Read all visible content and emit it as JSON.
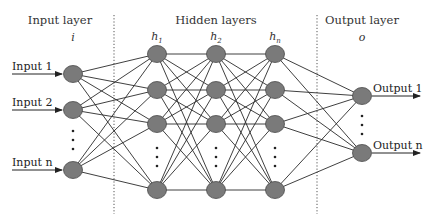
{
  "diagram": {
    "type": "feedforward-neural-network",
    "layers": [
      {
        "title": "Input layer",
        "symbol": "i"
      },
      {
        "title": "Hidden layers",
        "symbols": [
          "h1",
          "h2",
          "hn"
        ]
      },
      {
        "title": "Output layer",
        "symbol": "o"
      }
    ],
    "inputs": [
      "Input 1",
      "Input 2",
      "Input n"
    ],
    "outputs": [
      "Output 1",
      "Output n"
    ],
    "hidden_symbols": {
      "h1": {
        "base": "h",
        "sub": "1"
      },
      "h2": {
        "base": "h",
        "sub": "2"
      },
      "hn": {
        "base": "h",
        "sub": "n"
      }
    },
    "ellipsis": "⋮",
    "colors": {
      "node_fill": "#7a7a7a",
      "node_stroke": "#4a4a4a",
      "edge": "#2a2a2a",
      "separator": "#555555",
      "text": "#222222"
    }
  }
}
